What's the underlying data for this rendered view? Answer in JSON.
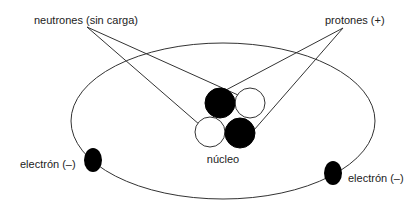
{
  "diagram": {
    "type": "atom-model",
    "labels": {
      "neutrons": "neutrones (sin carga)",
      "protons": "protones (+)",
      "nucleus": "núcleo",
      "electron_left": "electrón (–)",
      "electron_right": "electrón (–)"
    },
    "colors": {
      "line": "#333333",
      "proton_fill": "#000000",
      "neutron_fill": "#ffffff",
      "electron_fill": "#000000",
      "background": "#ffffff"
    },
    "nucleus": {
      "particles": [
        {
          "kind": "proton",
          "position": "top-left"
        },
        {
          "kind": "neutron",
          "position": "top-right"
        },
        {
          "kind": "neutron",
          "position": "bottom-left"
        },
        {
          "kind": "proton",
          "position": "bottom-right"
        }
      ]
    },
    "electrons": [
      {
        "position": "left"
      },
      {
        "position": "right"
      }
    ]
  }
}
